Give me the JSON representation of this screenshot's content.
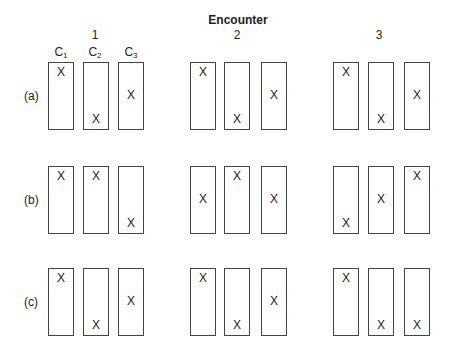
{
  "title": "Encounter",
  "encounters": [
    {
      "label": "1",
      "x": 95
    },
    {
      "label": "2",
      "x": 237
    },
    {
      "label": "3",
      "x": 379
    }
  ],
  "column_labels": [
    {
      "base": "C",
      "sub": "1",
      "x": 61
    },
    {
      "base": "C",
      "sub": "2",
      "x": 95
    },
    {
      "base": "C",
      "sub": "3",
      "x": 131
    }
  ],
  "box_x": [
    [
      48,
      83,
      118
    ],
    [
      190,
      224,
      261
    ],
    [
      333,
      368,
      404
    ]
  ],
  "rows": [
    {
      "label": "(a)",
      "top": 62,
      "label_y": 89,
      "marks": [
        [
          "top",
          "bottom",
          "mid"
        ],
        [
          "top",
          "bottom",
          "mid"
        ],
        [
          "top",
          "bottom",
          "mid"
        ]
      ]
    },
    {
      "label": "(b)",
      "top": 166,
      "label_y": 193,
      "marks": [
        [
          "top",
          "top",
          "bottom"
        ],
        [
          "mid",
          "top",
          "mid"
        ],
        [
          "bottom",
          "mid",
          "top"
        ]
      ]
    },
    {
      "label": "(c)",
      "top": 268,
      "label_y": 295,
      "marks": [
        [
          "top",
          "bottom",
          "mid"
        ],
        [
          "top",
          "bottom",
          "mid"
        ],
        [
          "top",
          "bottom",
          "bottom"
        ]
      ]
    }
  ],
  "mark_symbol": "X",
  "mark_offsets": {
    "top": 10,
    "mid": 33,
    "bottom": 57
  }
}
